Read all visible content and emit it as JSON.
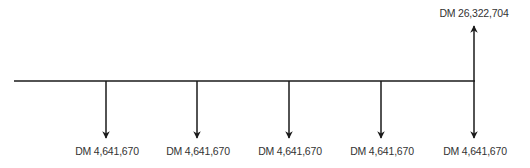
{
  "diagram": {
    "type": "cash-flow-timeline",
    "line_color": "#1a1a1a",
    "text_color": "#333333",
    "inflow": {
      "label": "DM 26,322,704",
      "period": 5
    },
    "outflows": [
      {
        "label": "DM 4,641,670",
        "period": 1
      },
      {
        "label": "DM 4,641,670",
        "period": 2
      },
      {
        "label": "DM 4,641,670",
        "period": 3
      },
      {
        "label": "DM 4,641,670",
        "period": 4
      },
      {
        "label": "DM 4,641,670",
        "period": 5
      }
    ]
  }
}
